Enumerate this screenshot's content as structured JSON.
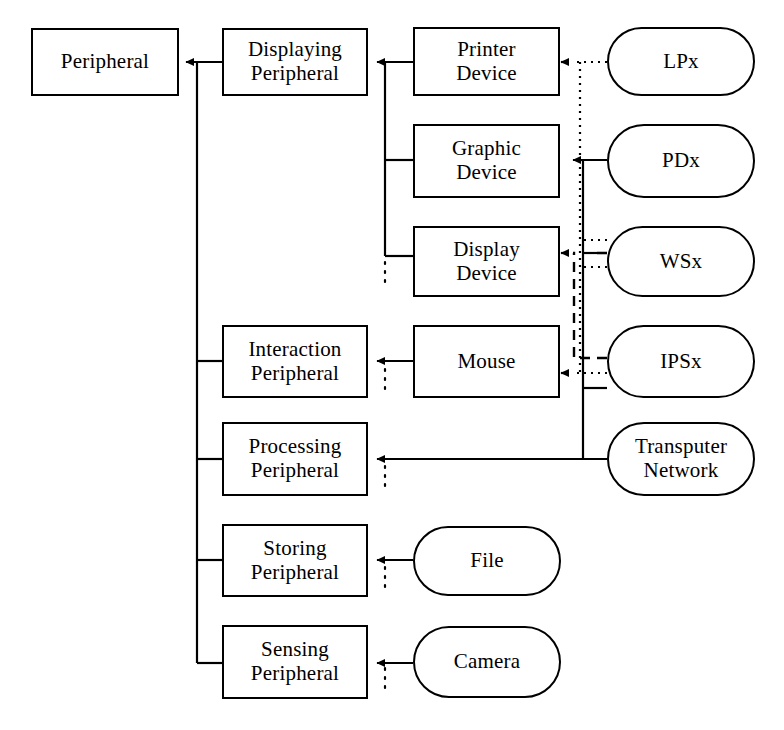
{
  "diagram": {
    "type": "hierarchy-block-diagram",
    "stroke_color": "#000000",
    "background_color": "#ffffff",
    "nodes": [
      {
        "id": "peripheral",
        "label": "Peripheral",
        "shape": "rect",
        "x": 31,
        "y": 28,
        "w": 148,
        "h": 68
      },
      {
        "id": "displaying-peripheral",
        "label": "Displaying\nPeripheral",
        "shape": "rect",
        "x": 222,
        "y": 28,
        "w": 146,
        "h": 68
      },
      {
        "id": "printer-device",
        "label": "Printer\nDevice",
        "shape": "rect",
        "x": 413,
        "y": 27,
        "w": 147,
        "h": 69
      },
      {
        "id": "lpx",
        "label": "LPx",
        "shape": "stadium",
        "x": 607,
        "y": 27,
        "w": 148,
        "h": 69
      },
      {
        "id": "graphic-device",
        "label": "Graphic\nDevice",
        "shape": "rect",
        "x": 413,
        "y": 124,
        "w": 147,
        "h": 74
      },
      {
        "id": "pdx",
        "label": "PDx",
        "shape": "stadium",
        "x": 607,
        "y": 124,
        "w": 148,
        "h": 74
      },
      {
        "id": "display-device",
        "label": "Display\nDevice",
        "shape": "rect",
        "x": 413,
        "y": 226,
        "w": 147,
        "h": 71
      },
      {
        "id": "wsx",
        "label": "WSx",
        "shape": "stadium",
        "x": 607,
        "y": 226,
        "w": 148,
        "h": 71
      },
      {
        "id": "interaction-peripheral",
        "label": "Interaction\nPeripheral",
        "shape": "rect",
        "x": 222,
        "y": 325,
        "w": 146,
        "h": 73
      },
      {
        "id": "mouse",
        "label": "Mouse",
        "shape": "rect",
        "x": 413,
        "y": 325,
        "w": 147,
        "h": 73
      },
      {
        "id": "ipsx",
        "label": "IPSx",
        "shape": "stadium",
        "x": 607,
        "y": 325,
        "w": 148,
        "h": 73
      },
      {
        "id": "processing-peripheral",
        "label": "Processing\nPeripheral",
        "shape": "rect",
        "x": 222,
        "y": 422,
        "w": 146,
        "h": 74
      },
      {
        "id": "transputer-network",
        "label": "Transputer\nNetwork",
        "shape": "stadium",
        "x": 607,
        "y": 422,
        "w": 148,
        "h": 74
      },
      {
        "id": "storing-peripheral",
        "label": "Storing\nPeripheral",
        "shape": "rect",
        "x": 222,
        "y": 524,
        "w": 146,
        "h": 73
      },
      {
        "id": "file",
        "label": "File",
        "shape": "stadium",
        "x": 413,
        "y": 526,
        "w": 148,
        "h": 70
      },
      {
        "id": "sensing-peripheral",
        "label": "Sensing\nPeripheral",
        "shape": "rect",
        "x": 222,
        "y": 625,
        "w": 146,
        "h": 74
      },
      {
        "id": "camera",
        "label": "Camera",
        "shape": "stadium",
        "x": 413,
        "y": 626,
        "w": 148,
        "h": 72
      }
    ],
    "edges": [
      {
        "id": "displaying-to-peripheral",
        "style": "solid",
        "from": "displaying-peripheral",
        "to": "peripheral",
        "arrow": true
      },
      {
        "id": "interaction-to-peripheral",
        "style": "solid",
        "from": "interaction-peripheral",
        "to": "peripheral-trunk",
        "arrow": false
      },
      {
        "id": "processing-to-peripheral",
        "style": "solid",
        "from": "processing-peripheral",
        "to": "peripheral-trunk",
        "arrow": false
      },
      {
        "id": "storing-to-peripheral",
        "style": "solid",
        "from": "storing-peripheral",
        "to": "peripheral-trunk",
        "arrow": false
      },
      {
        "id": "sensing-to-peripheral",
        "style": "solid",
        "from": "sensing-peripheral",
        "to": "peripheral-trunk",
        "arrow": false
      },
      {
        "id": "printer-to-displaying",
        "style": "solid",
        "from": "printer-device",
        "to": "displaying-peripheral",
        "arrow": true
      },
      {
        "id": "graphic-to-displaying",
        "style": "solid",
        "from": "graphic-device",
        "to": "displaying-trunk",
        "arrow": false
      },
      {
        "id": "display-to-displaying",
        "style": "solid",
        "from": "display-device",
        "to": "displaying-trunk",
        "arrow": false
      },
      {
        "id": "mouse-to-interaction",
        "style": "solid",
        "from": "mouse",
        "to": "interaction-peripheral",
        "arrow": true
      },
      {
        "id": "file-to-storing",
        "style": "solid",
        "from": "file",
        "to": "storing-peripheral",
        "arrow": true
      },
      {
        "id": "camera-to-sensing",
        "style": "solid",
        "from": "camera",
        "to": "sensing-peripheral",
        "arrow": true
      },
      {
        "id": "transputer-to-processing",
        "style": "solid",
        "from": "transputer-network",
        "to": "processing-peripheral",
        "arrow": true
      },
      {
        "id": "pdx-to-graphic",
        "style": "solid",
        "from": "pdx",
        "to": "graphic-device",
        "arrow": true
      },
      {
        "id": "wsx-to-display",
        "style": "solid",
        "from": "wsx",
        "to": "display-device",
        "arrow": false
      },
      {
        "id": "ipsx-to-transputer",
        "style": "solid",
        "from": "ipsx",
        "to": "transputer-link",
        "arrow": false
      },
      {
        "id": "lpx-to-printer",
        "style": "dotted",
        "from": "lpx",
        "to": "printer-device",
        "arrow": true
      },
      {
        "id": "lpx-down-to-ipsx",
        "style": "dotted",
        "from": "lpx",
        "to": "ipsx-row",
        "arrow": false
      },
      {
        "id": "wsx-dotted-down",
        "style": "dotted",
        "from": "wsx",
        "to": "ipsx-row",
        "arrow": false
      },
      {
        "id": "ipsx-to-mouse",
        "style": "dotted",
        "from": "ipsx",
        "to": "mouse",
        "arrow": true
      },
      {
        "id": "ipsx-dashed-to-display",
        "style": "dashed",
        "from": "ipsx",
        "to": "display-device",
        "arrow": true
      }
    ],
    "continuation_marks": [
      {
        "id": "more-displaying-devices",
        "x": 385,
        "y": 259
      },
      {
        "id": "more-interaction-devices",
        "x": 385,
        "y": 366
      },
      {
        "id": "more-processing-devices",
        "x": 385,
        "y": 463
      },
      {
        "id": "more-storing-devices",
        "x": 385,
        "y": 564
      },
      {
        "id": "more-sensing-devices",
        "x": 385,
        "y": 665
      }
    ]
  }
}
